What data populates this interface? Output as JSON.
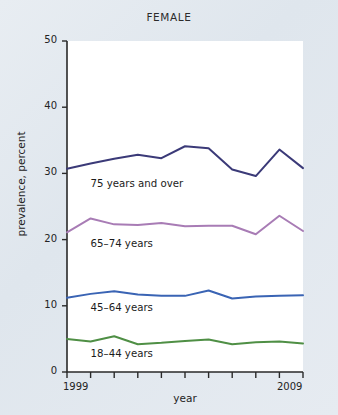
{
  "figure": {
    "background_color": "#e3e9ef",
    "panel_color": "#ffffff",
    "title": "FEMALE"
  },
  "axes": {
    "y_label": "prevalence, percent",
    "x_label": "year",
    "y_ticks": [
      "0",
      "10",
      "20",
      "30",
      "40",
      "50"
    ],
    "x_tick_labels": [
      "1999",
      "2009"
    ]
  },
  "chart_data": {
    "type": "line",
    "title": "FEMALE",
    "xlabel": "year",
    "ylabel": "prevalence, percent",
    "xlim": [
      1999,
      2009
    ],
    "ylim": [
      0,
      50
    ],
    "yticks": [
      0,
      10,
      20,
      30,
      40,
      50
    ],
    "xticks": [
      1999,
      2000,
      2001,
      2002,
      2003,
      2004,
      2005,
      2006,
      2007,
      2008,
      2009
    ],
    "grid": false,
    "legend": "inline-labels",
    "x": [
      1999,
      2000,
      2001,
      2002,
      2003,
      2004,
      2005,
      2006,
      2007,
      2008,
      2009
    ],
    "series": [
      {
        "name": "75 years and over",
        "color": "#3b3a78",
        "label_x": 2000.0,
        "label_y": 28.3,
        "values": [
          30.7,
          31.5,
          32.2,
          32.8,
          32.3,
          34.1,
          33.8,
          30.6,
          29.6,
          33.6,
          30.8
        ]
      },
      {
        "name": "65–74 years",
        "color": "#a87cb5",
        "label_x": 2000.0,
        "label_y": 19.2,
        "values": [
          21.1,
          23.2,
          22.3,
          22.2,
          22.5,
          22.0,
          22.1,
          22.1,
          20.8,
          23.6,
          21.3
        ]
      },
      {
        "name": "45–64 years",
        "color": "#3a64b4",
        "label_x": 2000.0,
        "label_y": 9.5,
        "values": [
          11.2,
          11.8,
          12.2,
          11.7,
          11.5,
          11.5,
          12.3,
          11.1,
          11.4,
          11.5,
          11.6
        ]
      },
      {
        "name": "18–44 years",
        "color": "#4f8f45",
        "label_x": 2000.0,
        "label_y": 2.6,
        "values": [
          5.0,
          4.6,
          5.4,
          4.2,
          4.4,
          4.7,
          4.9,
          4.2,
          4.5,
          4.6,
          4.3
        ]
      }
    ]
  }
}
